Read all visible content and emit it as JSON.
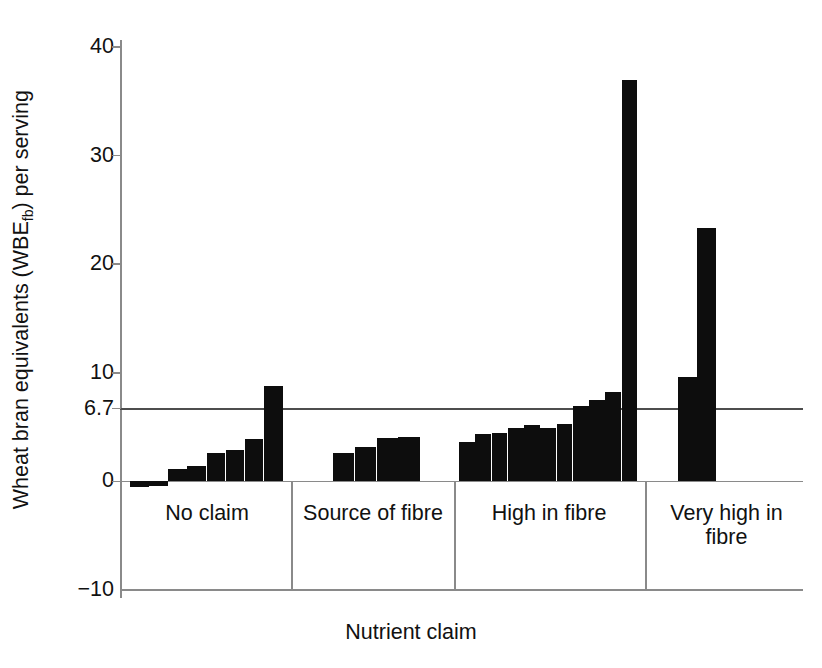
{
  "chart_data": {
    "type": "bar",
    "title": "",
    "xlabel": "Nutrient claim",
    "ylabel": "Wheat bran equivalents (WBE",
    "ylabel_sub": "fb",
    "ylabel_tail": ") per serving",
    "ylabel_full": "Wheat bran equivalents (WBEfb) per serving",
    "ylim": [
      -10,
      40
    ],
    "yticks": [
      40,
      30,
      20,
      10,
      6.7,
      0,
      -10
    ],
    "ytick_labels": [
      "40",
      "30",
      "20",
      "10",
      "6.7",
      "0",
      "−10"
    ],
    "grid": false,
    "legend": "none",
    "bar_color": "#0d0d0d",
    "reference_line": {
      "value": 6.7,
      "label": "6.7",
      "color": "#4d4d4d"
    },
    "categories": [
      "No claim",
      "Source of fibre",
      "High in fibre",
      "Very high in fibre"
    ],
    "groups": [
      {
        "category": "No claim",
        "values": [
          -0.5,
          -0.4,
          1.1,
          1.4,
          2.6,
          2.9,
          3.9,
          8.8
        ]
      },
      {
        "category": "Source of fibre",
        "values": [
          2.6,
          3.2,
          4.0,
          4.1
        ]
      },
      {
        "category": "High in fibre",
        "values": [
          3.6,
          4.4,
          4.5,
          4.9,
          5.2,
          4.9,
          5.3,
          6.9,
          7.5,
          8.2,
          37.0
        ]
      },
      {
        "category": "Very high in fibre",
        "values": [
          9.6,
          23.3
        ]
      }
    ]
  },
  "axis": {
    "x_title": "Nutrient claim",
    "y_title_main": "Wheat bran equivalents (WBE",
    "y_title_sub": "fb",
    "y_title_end": ") per serving"
  }
}
